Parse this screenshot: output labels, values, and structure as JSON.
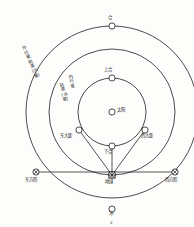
{
  "figure": {
    "caption": "2",
    "type": "planetary-configuration-diagram"
  },
  "colors": {
    "stroke": "#1d1d1d",
    "background": "#fdfdfc",
    "text": "#1a1a1a"
  },
  "center": {
    "sun_label": "太阳",
    "sun_cx": 112,
    "sun_cy": 112,
    "marker_r": 3.1
  },
  "orbits": [
    {
      "name": "inner-planet-orbit",
      "label_col1": "内行星",
      "label_col2": "轨道(水星)",
      "r": 34
    },
    {
      "name": "earth-orbit",
      "label": "",
      "r": 63
    },
    {
      "name": "outer-planet-orbit",
      "label": "外行星轨道(火星)",
      "r": 86
    }
  ],
  "points": {
    "conjunction": {
      "label": "合",
      "cx": 112,
      "cy": 26
    },
    "superior_conjunction": {
      "label": "上合",
      "cx": 112,
      "cy": 78
    },
    "inferior_conjunction": {
      "label": "下合",
      "cx": 112,
      "cy": 146
    },
    "greatest_eastern_elongation": {
      "label": "东大距",
      "cx": 79,
      "cy": 130
    },
    "greatest_western_elongation": {
      "label": "西大距",
      "cx": 145,
      "cy": 130
    },
    "eastern_quadrature": {
      "label": "东方照",
      "cx": 36,
      "cy": 172
    },
    "western_quadrature": {
      "label": "西方照",
      "cx": 175,
      "cy": 172
    },
    "earth": {
      "label": "地球",
      "cx": 112,
      "cy": 175
    },
    "opposition": {
      "label": "冲",
      "cx": 112,
      "cy": 209
    }
  }
}
